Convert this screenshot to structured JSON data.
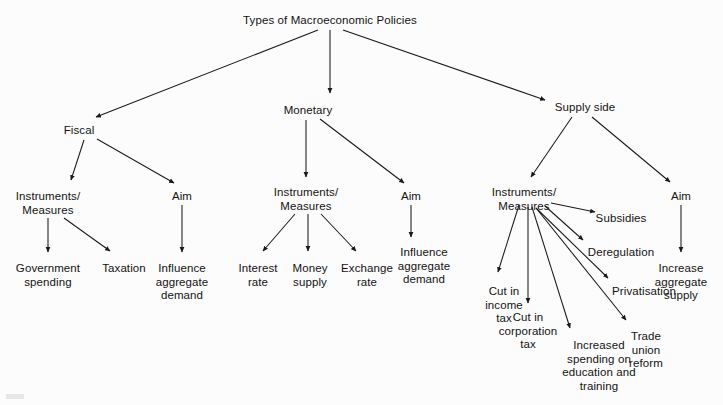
{
  "diagram": {
    "title": "Types of Macroeconomic Policies",
    "type": "hierarchical-tree",
    "background_color": "#fcfcfc",
    "line_color": "#1a1a1a",
    "text_color": "#131313",
    "nodes": [
      {
        "id": "root",
        "label": "Types of Macroeconomic Policies",
        "x": 330,
        "y": 14
      },
      {
        "id": "fiscal",
        "label": "Fiscal",
        "x": 79,
        "y": 124
      },
      {
        "id": "monetary",
        "label": "Monetary",
        "x": 308,
        "y": 104
      },
      {
        "id": "supply-side",
        "label": "Supply side",
        "x": 585,
        "y": 101
      },
      {
        "id": "fiscal-instruments",
        "label": "Instruments/\nMeasures",
        "x": 43,
        "y": 190
      },
      {
        "id": "fiscal-aim",
        "label": "Aim",
        "x": 180,
        "y": 190
      },
      {
        "id": "gov-spending",
        "label": "Government\nspending",
        "x": 41,
        "y": 262
      },
      {
        "id": "taxation",
        "label": "Taxation",
        "x": 124,
        "y": 262
      },
      {
        "id": "fiscal-influence",
        "label": "Influence\naggregate\ndemand",
        "x": 182,
        "y": 262
      },
      {
        "id": "monetary-instruments",
        "label": "Instruments/\nMeasures",
        "x": 304,
        "y": 186
      },
      {
        "id": "monetary-aim",
        "label": "Aim",
        "x": 411,
        "y": 190
      },
      {
        "id": "interest-rate",
        "label": "Interest\nrate",
        "x": 256,
        "y": 262
      },
      {
        "id": "money-supply",
        "label": "Money\nsupply",
        "x": 311,
        "y": 262
      },
      {
        "id": "exchange-rate",
        "label": "Exchange\nrate",
        "x": 370,
        "y": 262
      },
      {
        "id": "monetary-influence",
        "label": "Influence\naggregate\ndemand",
        "x": 425,
        "y": 246
      },
      {
        "id": "supply-instruments",
        "label": "Instruments/\nMeasures",
        "x": 523,
        "y": 186
      },
      {
        "id": "supply-aim",
        "label": "Aim",
        "x": 680,
        "y": 190
      },
      {
        "id": "subsidies",
        "label": "Subsidies",
        "x": 620,
        "y": 212
      },
      {
        "id": "deregulation",
        "label": "Deregulation",
        "x": 621,
        "y": 246
      },
      {
        "id": "privatisation",
        "label": "Privatisation",
        "x": 644,
        "y": 285
      },
      {
        "id": "cut-income-tax",
        "label": "Cut in\nincome\ntax",
        "x": 504,
        "y": 285
      },
      {
        "id": "cut-corporation-tax",
        "label": "Cut in\ncorporation\ntax",
        "x": 546,
        "y": 311
      },
      {
        "id": "increased-spending",
        "label": "Increased\nspending on\neducation and\ntraining",
        "x": 599,
        "y": 339
      },
      {
        "id": "trade-union-reform",
        "label": "Trade\nunion\nreform",
        "x": 646,
        "y": 330
      },
      {
        "id": "increase-supply",
        "label": "Increase\naggregate\nsupply",
        "x": 681,
        "y": 262
      }
    ],
    "edges": [
      {
        "from": "root",
        "to": "fiscal"
      },
      {
        "from": "root",
        "to": "monetary"
      },
      {
        "from": "root",
        "to": "supply-side"
      },
      {
        "from": "fiscal",
        "to": "fiscal-instruments"
      },
      {
        "from": "fiscal",
        "to": "fiscal-aim"
      },
      {
        "from": "fiscal-instruments",
        "to": "gov-spending"
      },
      {
        "from": "fiscal-instruments",
        "to": "taxation"
      },
      {
        "from": "fiscal-aim",
        "to": "fiscal-influence"
      },
      {
        "from": "monetary",
        "to": "monetary-instruments"
      },
      {
        "from": "monetary",
        "to": "monetary-aim"
      },
      {
        "from": "monetary-instruments",
        "to": "interest-rate"
      },
      {
        "from": "monetary-instruments",
        "to": "money-supply"
      },
      {
        "from": "monetary-instruments",
        "to": "exchange-rate"
      },
      {
        "from": "monetary-aim",
        "to": "monetary-influence"
      },
      {
        "from": "supply-side",
        "to": "supply-instruments"
      },
      {
        "from": "supply-side",
        "to": "supply-aim"
      },
      {
        "from": "supply-instruments",
        "to": "subsidies"
      },
      {
        "from": "supply-instruments",
        "to": "deregulation"
      },
      {
        "from": "supply-instruments",
        "to": "privatisation"
      },
      {
        "from": "supply-instruments",
        "to": "cut-income-tax"
      },
      {
        "from": "supply-instruments",
        "to": "cut-corporation-tax"
      },
      {
        "from": "supply-instruments",
        "to": "increased-spending"
      },
      {
        "from": "supply-instruments",
        "to": "trade-union-reform"
      },
      {
        "from": "supply-aim",
        "to": "increase-supply"
      }
    ]
  }
}
